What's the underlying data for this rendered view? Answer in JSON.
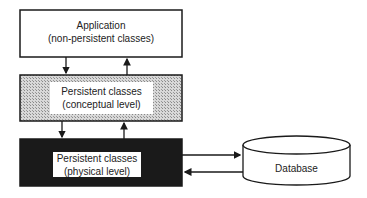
{
  "diagram": {
    "application": {
      "line1": "Application",
      "line2": "(non-persistent classes)"
    },
    "conceptual": {
      "line1": "Persistent classes",
      "line2": "(conceptual level)"
    },
    "physical": {
      "line1": "Persistent classes",
      "line2": "(physical level)"
    },
    "database": {
      "label": "Database"
    }
  },
  "colors": {
    "conceptual_fill": "#c8c8c8",
    "physical_fill": "#1a1a1a",
    "stroke": "#1a1a1a"
  }
}
